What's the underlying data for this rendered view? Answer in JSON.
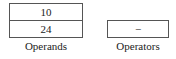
{
  "operands": {
    "label": "Operands",
    "values": [
      "10",
      "24"
    ]
  },
  "operators": {
    "label": "Operators",
    "values": [
      "−"
    ]
  }
}
